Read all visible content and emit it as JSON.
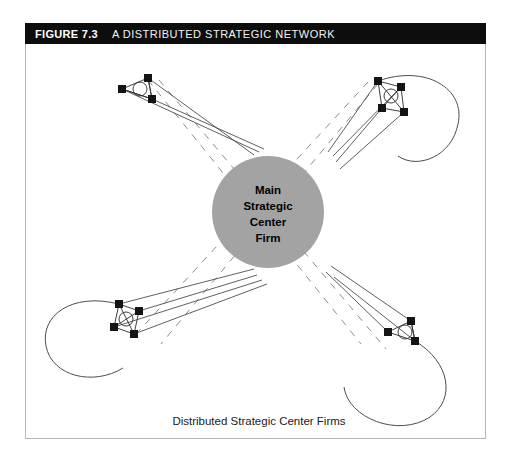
{
  "header": {
    "figure_number": "FIGURE 7.3",
    "title": "A DISTRIBUTED STRATEGIC NETWORK",
    "background_color": "#0d0d0d",
    "text_color": "#ffffff"
  },
  "center_node": {
    "label_lines": [
      "Main",
      "Strategic",
      "Center",
      "Firm"
    ],
    "line1": "Main",
    "line2": "Strategic",
    "line3": "Center",
    "line4": "Firm",
    "fill_color": "#a3a3a3",
    "cx": 268,
    "cy": 190,
    "r": 56
  },
  "caption": {
    "text": "Distributed Strategic Center Firms"
  },
  "diagram": {
    "type": "network-diagram",
    "frame_border_color": "#b6b6b6",
    "solid_edge_color": "#4d4d4d",
    "dashed_edge_color": "#8c8c8c",
    "node_color": "#141414",
    "clusters": [
      {
        "id": "cluster-top-left",
        "name": "Distributed Strategic Center Firm (top-left)",
        "node_count": 3,
        "has_inner_circle": true,
        "has_loop": false,
        "nodes": [
          [
            148,
            67
          ],
          [
            122,
            78
          ],
          [
            152,
            88
          ]
        ]
      },
      {
        "id": "cluster-top-right",
        "name": "Distributed Strategic Center Firm (top-right)",
        "node_count": 4,
        "has_inner_circle": true,
        "has_loop": true,
        "nodes": [
          [
            378,
            70
          ],
          [
            401,
            76
          ],
          [
            382,
            97
          ],
          [
            404,
            101
          ]
        ]
      },
      {
        "id": "cluster-bottom-left",
        "name": "Distributed Strategic Center Firm (bottom-left)",
        "node_count": 4,
        "has_inner_circle": true,
        "has_loop": true,
        "nodes": [
          [
            119,
            293
          ],
          [
            139,
            300
          ],
          [
            114,
            316
          ],
          [
            134,
            323
          ]
        ]
      },
      {
        "id": "cluster-bottom-right",
        "name": "Distributed Strategic Center Firm (bottom-right)",
        "node_count": 3,
        "has_inner_circle": true,
        "has_loop": true,
        "nodes": [
          [
            388,
            321
          ],
          [
            411,
            310
          ],
          [
            415,
            330
          ]
        ]
      }
    ],
    "dashed_connections": [
      "top-left to bottom-right",
      "top-right to bottom-left"
    ]
  }
}
